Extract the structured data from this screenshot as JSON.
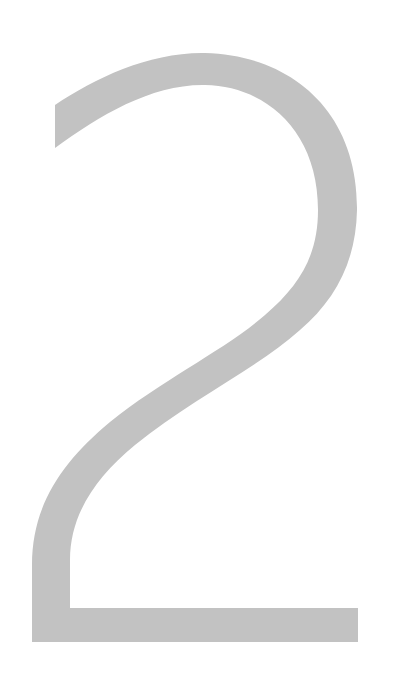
{
  "glyph": {
    "character": "2",
    "color": "#c2c2c2",
    "background": "#ffffff"
  }
}
